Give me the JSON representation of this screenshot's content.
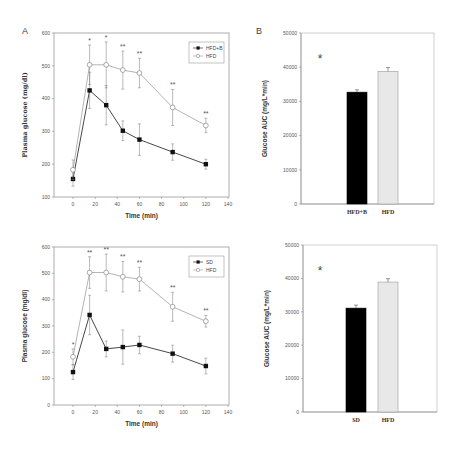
{
  "figure": {
    "panel_labels": [
      "A",
      "B"
    ]
  },
  "chart_data": [
    {
      "id": "top_line",
      "type": "line",
      "panel": "A",
      "title": "",
      "xlabel": "Time (min)",
      "ylabel": "Plasma glucose (mg/dl)",
      "xlim": [
        -10,
        140
      ],
      "ylim": [
        100,
        600
      ],
      "xticks": [
        0,
        20,
        40,
        60,
        80,
        100,
        120,
        140
      ],
      "yticks": [
        100,
        200,
        300,
        400,
        500,
        600
      ],
      "grid": false,
      "legend_position": "upper right",
      "x": [
        0,
        15,
        30,
        45,
        60,
        90,
        120
      ],
      "series": [
        {
          "name": "HFD+B",
          "marker": "filled-square",
          "values": [
            155,
            425,
            380,
            302,
            275,
            237,
            200
          ],
          "errors": [
            22,
            55,
            60,
            30,
            48,
            25,
            15
          ]
        },
        {
          "name": "HFD",
          "marker": "open-circle",
          "values": [
            183,
            503,
            503,
            487,
            478,
            373,
            318
          ],
          "errors": [
            30,
            60,
            70,
            58,
            45,
            55,
            22
          ]
        }
      ],
      "significance": [
        "",
        "*",
        "*",
        "**",
        "**",
        "**",
        "**"
      ]
    },
    {
      "id": "top_bar",
      "type": "bar",
      "panel": "B",
      "title": "",
      "xlabel": "",
      "ylabel": "Glucose AUC (mg/L*min)",
      "categories": [
        "HFD+B",
        "HFD"
      ],
      "values": [
        32700,
        38800
      ],
      "errors": [
        700,
        1100
      ],
      "colors": [
        "#000000",
        "#e8e8e8"
      ],
      "ylim": [
        0,
        50000
      ],
      "yticks": [
        0,
        10000,
        20000,
        30000,
        40000,
        50000
      ],
      "annotation": "*"
    },
    {
      "id": "bottom_line",
      "type": "line",
      "title": "",
      "xlabel": "Time (min)",
      "ylabel": "Plasma glucose (mg/dl)",
      "xlim": [
        -10,
        140
      ],
      "ylim": [
        0,
        600
      ],
      "xticks": [
        0,
        20,
        40,
        60,
        80,
        100,
        120,
        140
      ],
      "yticks": [
        0,
        100,
        200,
        300,
        400,
        500,
        600
      ],
      "grid": false,
      "legend_position": "upper right",
      "x": [
        0,
        15,
        30,
        45,
        60,
        90,
        120
      ],
      "series": [
        {
          "name": "SD",
          "marker": "filled-square",
          "values": [
            125,
            342,
            213,
            220,
            228,
            195,
            148
          ],
          "errors": [
            28,
            75,
            30,
            65,
            33,
            32,
            30
          ]
        },
        {
          "name": "HFD",
          "marker": "open-circle",
          "values": [
            183,
            503,
            503,
            487,
            478,
            373,
            318
          ],
          "errors": [
            30,
            60,
            70,
            58,
            45,
            55,
            22
          ]
        }
      ],
      "significance": [
        "*",
        "**",
        "**",
        "**",
        "**",
        "**",
        "**"
      ]
    },
    {
      "id": "bottom_bar",
      "type": "bar",
      "title": "",
      "xlabel": "",
      "ylabel": "Glucose AUC (mg/L*min)",
      "categories": [
        "SD",
        "HFD"
      ],
      "values": [
        31100,
        38900
      ],
      "errors": [
        900,
        1000
      ],
      "colors": [
        "#000000",
        "#e8e8e8"
      ],
      "ylim": [
        0,
        50000
      ],
      "yticks": [
        0,
        10000,
        20000,
        30000,
        40000,
        50000
      ],
      "annotation": "*"
    }
  ]
}
